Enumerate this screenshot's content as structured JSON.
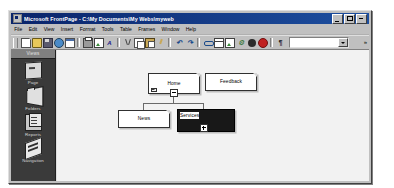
{
  "window": {
    "title": "Microsoft FrontPage - C:\\My Documents\\My Webs\\myweb",
    "app_icon": "frontpage-icon",
    "buttons": {
      "minimize": "Minimize",
      "maximize": "Maximize",
      "close": "Close"
    }
  },
  "menu": {
    "items": [
      {
        "label": "File"
      },
      {
        "label": "Edit"
      },
      {
        "label": "View"
      },
      {
        "label": "Insert"
      },
      {
        "label": "Format"
      },
      {
        "label": "Tools"
      },
      {
        "label": "Table"
      },
      {
        "label": "Frames"
      },
      {
        "label": "Window"
      },
      {
        "label": "Help"
      }
    ]
  },
  "toolbar": {
    "buttons": [
      {
        "name": "new-page-button",
        "icon": "new-document-icon"
      },
      {
        "name": "open-button",
        "icon": "open-folder-icon"
      },
      {
        "name": "save-button",
        "icon": "save-disk-icon"
      },
      {
        "name": "publish-button",
        "icon": "publish-web-icon"
      },
      {
        "name": "folder-list-button",
        "icon": "folder-list-icon"
      },
      {
        "name": "print-button",
        "icon": "printer-icon"
      },
      {
        "name": "preview-browser-button",
        "icon": "preview-in-browser-icon"
      },
      {
        "name": "spelling-button",
        "icon": "spelling-check-icon"
      },
      {
        "name": "cut-button",
        "icon": "scissors-icon"
      },
      {
        "name": "copy-button",
        "icon": "copy-icon"
      },
      {
        "name": "paste-button",
        "icon": "clipboard-paste-icon"
      },
      {
        "name": "format-painter-button",
        "icon": "paintbrush-icon"
      },
      {
        "name": "undo-button",
        "icon": "undo-arrow-icon"
      },
      {
        "name": "redo-button",
        "icon": "redo-arrow-icon"
      },
      {
        "name": "insert-component-button",
        "icon": "component-icon"
      },
      {
        "name": "insert-table-button",
        "icon": "table-icon"
      },
      {
        "name": "insert-image-button",
        "icon": "picture-icon"
      },
      {
        "name": "hyperlink-button",
        "icon": "hyperlink-icon"
      },
      {
        "name": "refresh-button",
        "icon": "refresh-icon"
      },
      {
        "name": "stop-button",
        "icon": "stop-icon"
      },
      {
        "name": "show-all-button",
        "icon": "show-all-icon"
      },
      {
        "name": "zoom-box-button",
        "icon": "zoom-icon"
      },
      {
        "name": "help-button",
        "icon": "help-question-icon"
      }
    ],
    "combo_value": "",
    "overflow_label": "»"
  },
  "views_bar": {
    "header": "Views",
    "items": [
      {
        "label": "Page",
        "icon": "page-view-icon",
        "selected": false
      },
      {
        "label": "Folders",
        "icon": "folders-view-icon",
        "selected": false
      },
      {
        "label": "Reports",
        "icon": "reports-view-icon",
        "selected": false
      },
      {
        "label": "Navigation",
        "icon": "navigation-view-icon",
        "selected": true
      }
    ]
  },
  "navigation_view": {
    "nodes": [
      {
        "id": "home",
        "label": "Home",
        "is_home": true,
        "selected": false,
        "toggle": "minus"
      },
      {
        "id": "feedback",
        "label": "Feedback",
        "is_home": false,
        "selected": false,
        "toggle": null
      },
      {
        "id": "news",
        "label": "News",
        "is_home": false,
        "selected": false,
        "toggle": null
      },
      {
        "id": "services",
        "label": "Services",
        "is_home": false,
        "selected": true,
        "toggle": "plus"
      }
    ]
  }
}
